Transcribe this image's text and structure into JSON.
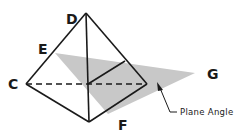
{
  "figure": {
    "type": "tetrahedron-plane-angle",
    "labels": {
      "D": "D",
      "E": "E",
      "C": "C",
      "F": "F",
      "G": "G"
    },
    "annotation": "Plane Angle",
    "colors": {
      "stroke": "#1a1a1a",
      "plane_fill": "#c8c8c8",
      "background": "#ffffff"
    }
  }
}
